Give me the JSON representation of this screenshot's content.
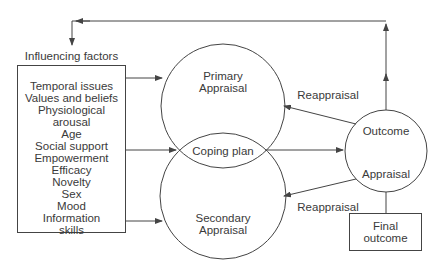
{
  "diagram": {
    "influencing_factors": {
      "title": "Influencing factors",
      "items": [
        "Temporal issues",
        "Values and beliefs",
        "Physiological arousal",
        "Age",
        "Social support",
        "Empowerment",
        "Efficacy",
        "Novelty",
        "Sex",
        "Mood",
        "Information",
        "skills"
      ]
    },
    "primary_appraisal": {
      "line1": "Primary",
      "line2": "Appraisal"
    },
    "coping_plan": {
      "label": "Coping plan"
    },
    "secondary_appraisal": {
      "line1": "Secondary",
      "line2": "Appraisal"
    },
    "outcome_appraisal": {
      "line1": "Outcome",
      "line2": "Appraisal"
    },
    "reappraisal_top": {
      "label": "Reappraisal"
    },
    "reappraisal_bottom": {
      "label": "Reappraisal"
    },
    "final_outcome": {
      "line1": "Final",
      "line2": "outcome"
    },
    "colors": {
      "stroke": "#444444",
      "text": "#3a3a3a",
      "background": "#ffffff"
    }
  }
}
